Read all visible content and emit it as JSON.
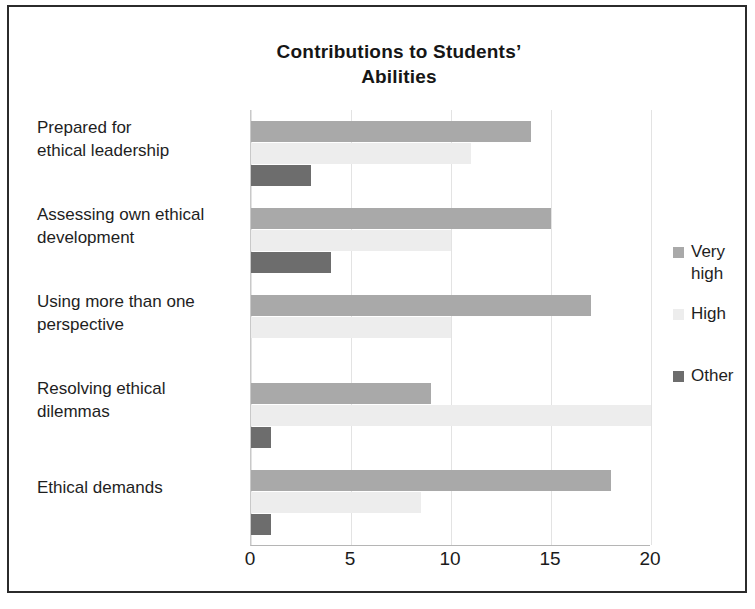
{
  "chart_data": {
    "type": "bar",
    "orientation": "horizontal",
    "title": "Contributions to Students’ Abilities",
    "title_lines": [
      "Contributions to Students’",
      "Abilities"
    ],
    "xlabel": "",
    "ylabel": "",
    "xlim": [
      0,
      20
    ],
    "xticks": [
      0,
      5,
      10,
      15,
      20
    ],
    "xtick_labels": [
      "0",
      "5",
      "10",
      "15",
      "20"
    ],
    "grid": true,
    "legend_position": "right",
    "categories": [
      "Prepared for ethical leadership",
      "Assessing own ethical development",
      "Using more than one perspective",
      "Resolving ethical dilemmas",
      "Ethical demands"
    ],
    "category_lines": [
      [
        "Prepared for",
        "ethical leadership"
      ],
      [
        "Assessing own ethical",
        "development"
      ],
      [
        "Using more than one",
        "perspective"
      ],
      [
        "Resolving ethical",
        "dilemmas"
      ],
      [
        "Ethical demands"
      ]
    ],
    "series": [
      {
        "name": "Very high",
        "name_lines": [
          "Very",
          "high"
        ],
        "color": "#a9a9a9",
        "values": [
          14,
          15,
          17,
          9,
          18
        ]
      },
      {
        "name": "High",
        "name_lines": [
          "High"
        ],
        "color": "#ededed",
        "values": [
          11,
          10,
          10,
          20,
          8.5
        ]
      },
      {
        "name": "Other",
        "name_lines": [
          "Other"
        ],
        "color": "#6d6d6d",
        "values": [
          3,
          4,
          0,
          1,
          1
        ]
      }
    ]
  },
  "colors": {
    "very_high": "#a9a9a9",
    "high": "#ededed",
    "other": "#6d6d6d",
    "frame_border": "#2b2b2b",
    "gridline": "#e3e3e3",
    "text": "#1a1a1a"
  }
}
